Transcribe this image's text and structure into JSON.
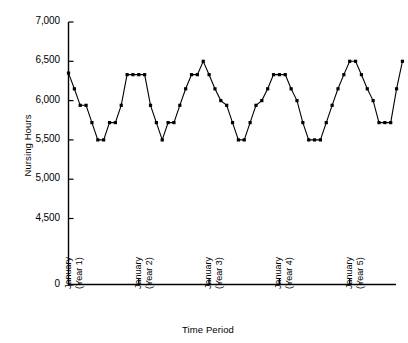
{
  "chart_data": {
    "type": "line",
    "title": "",
    "xlabel": "Time Period",
    "ylabel": "Nursing Hours",
    "grid": false,
    "legend": null,
    "marker": "square",
    "line_color": "#000000",
    "axis_broken": true,
    "ylim": [
      4500,
      7000
    ],
    "yticks": [
      0,
      4500,
      5000,
      5500,
      6000,
      6500,
      7000
    ],
    "ytick_labels": [
      "0",
      "4,500",
      "5,000",
      "5,500",
      "6,000",
      "6,500",
      "7,000"
    ],
    "xtick_positions": [
      0,
      12,
      24,
      36,
      48
    ],
    "xtick_labels": [
      {
        "line1": "January",
        "line2": "(Year 1)"
      },
      {
        "line1": "January",
        "line2": "(Year 2)"
      },
      {
        "line1": "January",
        "line2": "(Year 3)"
      },
      {
        "line1": "January",
        "line2": "(Year 4)"
      },
      {
        "line1": "January",
        "line2": "(Year 5)"
      }
    ],
    "x": [
      0,
      1,
      2,
      3,
      4,
      5,
      6,
      7,
      8,
      9,
      10,
      11,
      12,
      13,
      14,
      15,
      16,
      17,
      18,
      19,
      20,
      21,
      22,
      23,
      24,
      25,
      26,
      27,
      28,
      29,
      30,
      31,
      32,
      33,
      34,
      35,
      36,
      37,
      38,
      39,
      40,
      41,
      42,
      43,
      44,
      45,
      46,
      47,
      48,
      49,
      50,
      51,
      52,
      53,
      54,
      55,
      56,
      57
    ],
    "values": [
      6350,
      6150,
      5940,
      5940,
      5720,
      5500,
      5500,
      5720,
      5720,
      5940,
      6330,
      6330,
      6330,
      6330,
      5940,
      5720,
      5500,
      5720,
      5720,
      5940,
      6150,
      6330,
      6330,
      6500,
      6330,
      6150,
      6000,
      5940,
      5720,
      5500,
      5500,
      5720,
      5940,
      6000,
      6150,
      6330,
      6330,
      6330,
      6150,
      6000,
      5720,
      5500,
      5500,
      5500,
      5720,
      5940,
      6150,
      6330,
      6500,
      6500,
      6330,
      6150,
      6000,
      5720,
      5720,
      5720,
      6150,
      6500
    ],
    "series_name": "Nursing Hours"
  },
  "axes": {
    "y_axis_label": "Nursing Hours",
    "x_axis_label": "Time Period"
  }
}
